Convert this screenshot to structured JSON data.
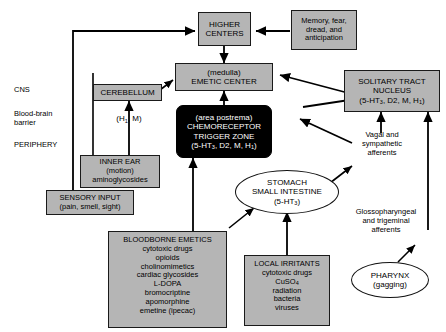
{
  "diagram": {
    "colors": {
      "box_fill": "#b5b5b5",
      "box_stroke": "#1a1a1a",
      "dark_fill": "#000000",
      "dark_text": "#ffffff",
      "ellipse_fill": "#ffffff",
      "arrow": "#000000",
      "background": "#ffffff"
    }
  },
  "side_labels": {
    "cns": "CNS",
    "barrier_line1": "Blood-brain",
    "barrier_line2": "barrier",
    "periphery": "PERIPHERY"
  },
  "nodes": {
    "higher_centers": {
      "line1": "HIGHER",
      "line2": "CENTERS"
    },
    "memory": {
      "line1": "Memory, fear,",
      "line2": "dread, and",
      "line3": "anticipation"
    },
    "emetic_center": {
      "line1": "(medulla)",
      "line2": "EMETIC CENTER"
    },
    "solitary_tract": {
      "line1": "SOLITARY TRACT",
      "line2": "NUCLEUS",
      "line3_pre": "(5-HT",
      "line3_sub": "3",
      "line3_post": ", D2, M, H",
      "line3_sub2": "1",
      "line3_end": ")"
    },
    "ctz": {
      "line1": "(area postrema)",
      "line2": "CHEMORECEPTOR",
      "line3": "TRIGGER ZONE",
      "line4_pre": "(5-HT",
      "line4_sub": "3",
      "line4_post": ", D2, M, H",
      "line4_sub2": "1",
      "line4_end": ")"
    },
    "cerebellum": {
      "line1": "CEREBELLUM"
    },
    "inner_ear": {
      "line1": "INNER EAR",
      "line2": "(motion)",
      "line3": "aminoglycosides"
    },
    "sensory_input": {
      "line1": "SENSORY INPUT",
      "line2": "(pain, smell, sight)"
    },
    "stomach": {
      "line1": "STOMACH",
      "line2": "SMALL INTESTINE",
      "line3_pre": "(5-HT",
      "line3_sub": "3",
      "line3_end": ")"
    },
    "pharynx": {
      "line1": "PHARYNX",
      "line2": "(gagging)"
    },
    "bloodborne_emetics": {
      "title": "BLOODBORNE EMETICS",
      "items": [
        "cytotoxic drugs",
        "opioids",
        "cholinomimetics",
        "cardiac glycosides",
        "L-DOPA",
        "bromocriptine",
        "apomorphine",
        "emetine (ipecac)"
      ]
    },
    "local_irritants": {
      "title": "LOCAL IRRITANTS",
      "items": [
        "cytotoxic drugs",
        "CuSO4",
        "radiation",
        "bacteria",
        "viruses"
      ],
      "cuso4_pre": "CuSO",
      "cuso4_sub": "4"
    }
  },
  "edge_labels": {
    "h1_m_pre": "(H",
    "h1_m_sub": "1",
    "h1_m_post": ", M)",
    "vagal_line1": "Vagal and",
    "vagal_line2": "sympathetic",
    "vagal_line3": "afferents",
    "glosso_line1": "Glossopharyngeal",
    "glosso_line2": "and trigeminal",
    "glosso_line3": "afferents"
  }
}
